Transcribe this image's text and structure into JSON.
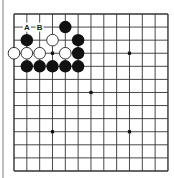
{
  "board": {
    "size": 13,
    "origin_x": 14,
    "origin_y": 14,
    "spacing_x": 12.83,
    "spacing_y": 13.08,
    "line_color": "#333333",
    "star_points": [
      [
        3,
        3
      ],
      [
        9,
        3
      ],
      [
        6,
        6
      ],
      [
        3,
        9
      ],
      [
        9,
        9
      ]
    ],
    "stones": [
      {
        "color": "black",
        "col": 4,
        "row": 1
      },
      {
        "color": "black",
        "col": 1,
        "row": 2
      },
      {
        "color": "white",
        "col": 3,
        "row": 2
      },
      {
        "color": "black",
        "col": 5,
        "row": 2
      },
      {
        "color": "white",
        "col": 0,
        "row": 3
      },
      {
        "color": "white",
        "col": 1,
        "row": 3
      },
      {
        "color": "white",
        "col": 2,
        "row": 3
      },
      {
        "color": "white",
        "col": 4,
        "row": 3
      },
      {
        "color": "black",
        "col": 5,
        "row": 3
      },
      {
        "color": "black",
        "col": 1,
        "row": 4
      },
      {
        "color": "black",
        "col": 2,
        "row": 4
      },
      {
        "color": "black",
        "col": 3,
        "row": 4
      },
      {
        "color": "black",
        "col": 4,
        "row": 4
      },
      {
        "color": "black",
        "col": 5,
        "row": 4
      }
    ],
    "labels": [
      {
        "text": "A",
        "col": 1,
        "row": 1
      },
      {
        "text": "B",
        "col": 2,
        "row": 1
      }
    ],
    "colors": {
      "black_stone": "#111111",
      "white_stone": "#ffffff",
      "white_stone_outline": "#222222"
    }
  }
}
